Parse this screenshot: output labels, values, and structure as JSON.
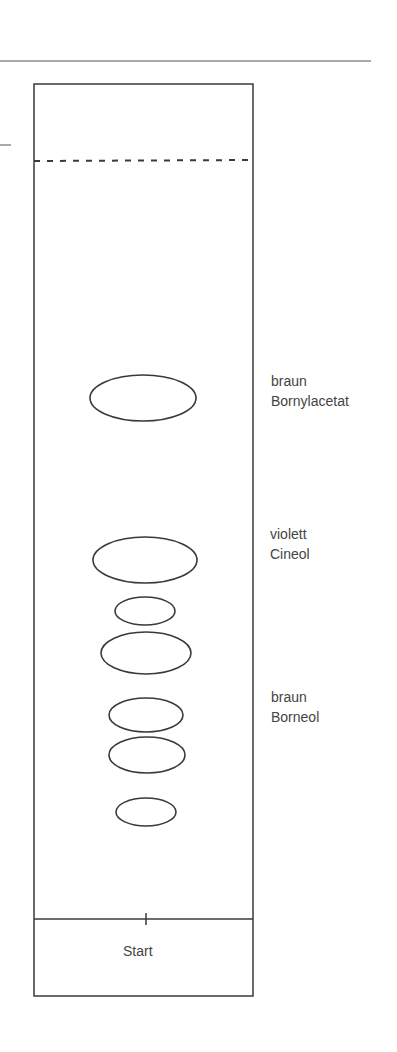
{
  "diagram": {
    "type": "thin-layer-chromatogram",
    "start_label": "Start",
    "spots": [
      {
        "cx": 143,
        "cy": 398,
        "rx": 53,
        "ry": 23
      },
      {
        "cx": 145,
        "cy": 560,
        "rx": 52,
        "ry": 23
      },
      {
        "cx": 145,
        "cy": 611,
        "rx": 30,
        "ry": 14
      },
      {
        "cx": 146,
        "cy": 653,
        "rx": 45,
        "ry": 21
      },
      {
        "cx": 146,
        "cy": 715,
        "rx": 37,
        "ry": 17
      },
      {
        "cx": 147,
        "cy": 755,
        "rx": 38,
        "ry": 18
      },
      {
        "cx": 146,
        "cy": 812,
        "rx": 30,
        "ry": 14
      }
    ],
    "annotations": [
      {
        "color": "braun",
        "compound": "Bornylacetat"
      },
      {
        "color": "violett",
        "compound": "Cineol"
      },
      {
        "color": "braun",
        "compound": "Borneol"
      }
    ],
    "stroke_color": "#3a3a3a"
  }
}
